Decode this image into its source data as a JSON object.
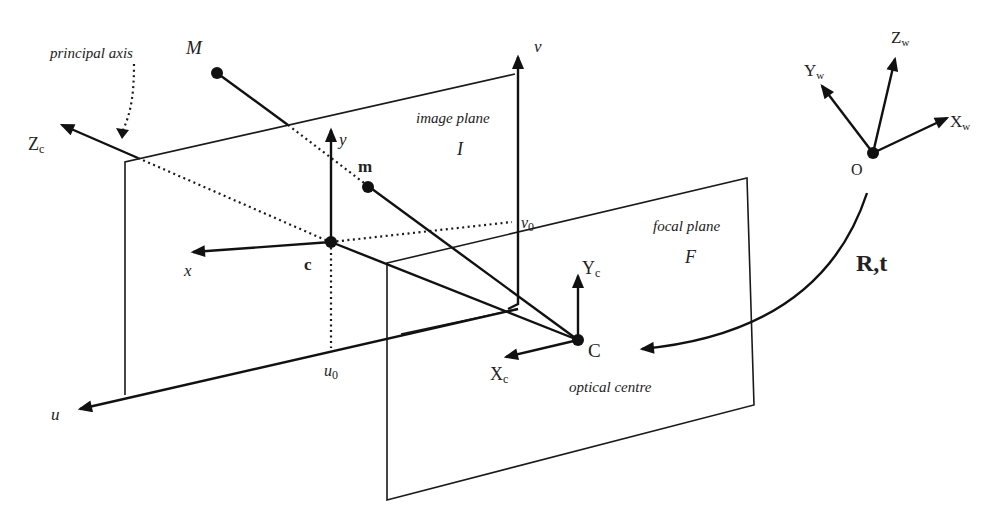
{
  "diagram": {
    "labels": {
      "principal_axis": "principal axis",
      "M": "M",
      "m": "m",
      "c": "c",
      "C": "C",
      "O": "O",
      "image_plane": "image plane",
      "image_plane_symbol": "I",
      "focal_plane": "focal plane",
      "focal_plane_symbol": "F",
      "optical_centre": "optical centre",
      "u": "u",
      "v": "v",
      "u0_base": "u",
      "u0_sub": "0",
      "v0_base": "v",
      "v0_sub": "0",
      "x": "x",
      "y": "y",
      "Zc_base": "Z",
      "Zc_sub": "c",
      "Yc_base": "Y",
      "Yc_sub": "c",
      "Xc_base": "X",
      "Xc_sub": "c",
      "Xw_base": "X",
      "Xw_sub": "w",
      "Yw_base": "Y",
      "Yw_sub": "w",
      "Zw_base": "Z",
      "Zw_sub": "w",
      "transform": "R,t"
    },
    "colors": {
      "ink": "#111111",
      "background": "#ffffff"
    }
  }
}
